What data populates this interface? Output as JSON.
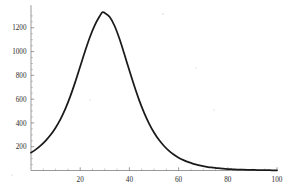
{
  "chart_data": {
    "type": "line",
    "title": "",
    "subtitle": "",
    "xlabel": "",
    "ylabel": "",
    "xlim": [
      0,
      100
    ],
    "ylim": [
      0,
      1400
    ],
    "grid": false,
    "legend": null,
    "background_color": "#ffffff",
    "curve_color": "#1a1a1a",
    "axis_color": "#6e6e6e",
    "x_ticks_major": [
      20,
      40,
      60,
      80,
      100
    ],
    "x_tick_labels": [
      "20",
      "40",
      "60",
      "80",
      "100"
    ],
    "x_ticks_minor": [
      5,
      10,
      15,
      25,
      30,
      35,
      45,
      50,
      55,
      65,
      70,
      75,
      85,
      90,
      95
    ],
    "y_ticks_major": [
      200,
      400,
      600,
      800,
      1000,
      1200
    ],
    "y_tick_labels": [
      "200",
      "400",
      "600",
      "800",
      "1000",
      "1200"
    ],
    "y_ticks_minor": [
      50,
      100,
      150,
      250,
      300,
      350,
      450,
      500,
      550,
      650,
      700,
      750,
      850,
      900,
      950,
      1050,
      1100,
      1150,
      1250,
      1300
    ],
    "peak": {
      "x": 29,
      "y": 1330
    },
    "series": [
      {
        "name": "distribution",
        "x": [
          0,
          2,
          4,
          6,
          8,
          10,
          12,
          14,
          16,
          18,
          20,
          22,
          24,
          26,
          28,
          29,
          30,
          32,
          34,
          36,
          38,
          40,
          42,
          44,
          46,
          48,
          50,
          52,
          54,
          56,
          58,
          60,
          62,
          64,
          66,
          68,
          70,
          72,
          74,
          76,
          78,
          80,
          82,
          84,
          86,
          88,
          90,
          92,
          94,
          96,
          98,
          100
        ],
        "y": [
          150,
          178,
          212,
          252,
          300,
          360,
          432,
          520,
          625,
          745,
          875,
          1005,
          1125,
          1225,
          1300,
          1330,
          1325,
          1290,
          1215,
          1105,
          975,
          840,
          710,
          590,
          485,
          395,
          320,
          258,
          208,
          167,
          134,
          108,
          87,
          70,
          56,
          45,
          36,
          29,
          24,
          19,
          15,
          12,
          10,
          8,
          7,
          6,
          5,
          4,
          3,
          3,
          2,
          2
        ]
      }
    ]
  }
}
